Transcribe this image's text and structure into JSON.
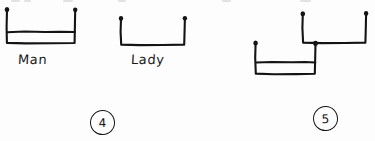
{
  "page": {
    "width": 375,
    "height": 141,
    "background_color": "#fdfdfd",
    "ink_color": "#141414",
    "media": "scanned handwritten pen drawing"
  },
  "figures": [
    {
      "id": "figure-4",
      "number_label": "4",
      "number_label_style": "circled",
      "vessels": [
        {
          "id": "man-vessel",
          "label": "Man",
          "shape": "u-shaped-container",
          "filled": true,
          "fill_level_description": "horizontal line near the bottom of the container"
        },
        {
          "id": "lady-vessel",
          "label": "Lady",
          "shape": "u-shaped-container",
          "filled": false,
          "fill_level_description": "empty"
        }
      ]
    },
    {
      "id": "figure-5",
      "number_label": "5",
      "number_label_style": "circled",
      "vessels": [
        {
          "id": "upper-vessel",
          "label": "",
          "shape": "u-shaped-container",
          "filled": false,
          "fill_level_description": "empty"
        },
        {
          "id": "lower-vessel",
          "label": "",
          "shape": "u-shaped-container",
          "filled": true,
          "fill_level_description": "horizontal line near the bottom of the container"
        }
      ]
    }
  ],
  "labels": {
    "man": "Man",
    "lady": "Lady",
    "number_four": "4",
    "number_five": "5"
  }
}
